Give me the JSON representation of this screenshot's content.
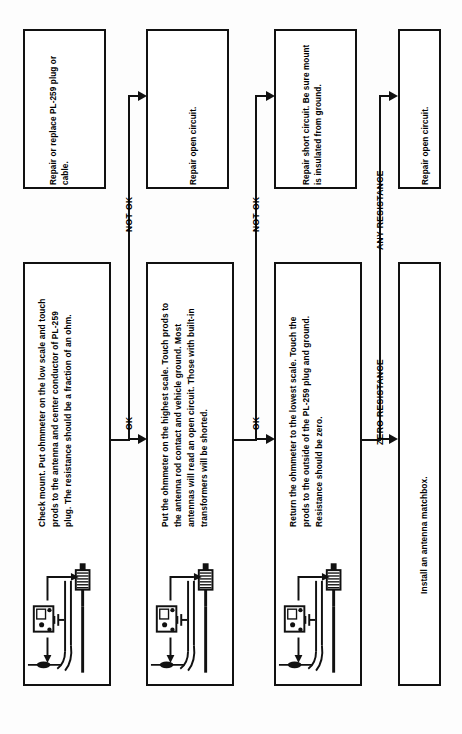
{
  "document": {
    "type": "flowchart",
    "orientation": "rotated-90-ccw",
    "title": "CB Antenna Ohmmeter Troubleshooting Flowchart"
  },
  "process_boxes": [
    {
      "id": "check-mount",
      "text": "Check mount. Put ohmmeter on the low scale and touch prods to the antenna and center conductor of PL-259 plug. The resistance should be a fraction of an ohm.",
      "has_schematic": true
    },
    {
      "id": "highest-scale",
      "text": "Put the ohmmeter on the highest scale. Touch prods to the antenna rod contact and vehicle ground. Most antennas will read an open circuit. Those with built-in transformers will be shorted.",
      "has_schematic": true
    },
    {
      "id": "lowest-scale",
      "text": "Return the ohmmeter to the lowest scale. Touch the prods to the outside of the PL-259 plug and ground. Resistance should be zero.",
      "has_schematic": true
    },
    {
      "id": "install-matchbox",
      "text": "Install an antenna matchbox.",
      "has_schematic": false
    }
  ],
  "outcome_boxes": [
    {
      "id": "repair-plug-cable",
      "text": "Repair or replace PL-259 plug or cable."
    },
    {
      "id": "repair-open-circuit-1",
      "text": "Repair open circuit."
    },
    {
      "id": "repair-short-circuit",
      "text": "Repair short circuit.  Be  sure mount is insulated from ground."
    },
    {
      "id": "repair-open-circuit-2",
      "text": "Repair open circuit."
    }
  ],
  "branch_labels": [
    {
      "id": "branch-ok-1",
      "text": "OK"
    },
    {
      "id": "branch-not-ok-1",
      "text": "NOT OK"
    },
    {
      "id": "branch-ok-2",
      "text": "OK"
    },
    {
      "id": "branch-not-ok-2",
      "text": "NOT OK"
    },
    {
      "id": "branch-zero-resistance",
      "text": "ZERO RESISTANCE"
    },
    {
      "id": "branch-any-resistance",
      "text": "ANY RESISTANCE"
    }
  ],
  "schematic": {
    "parts": [
      {
        "name": "ohmmeter-body",
        "label": ""
      },
      {
        "name": "test-prod",
        "label": ""
      },
      {
        "name": "ground-symbol",
        "label": ""
      },
      {
        "name": "pl259-plug",
        "label": ""
      },
      {
        "name": "coax-cable",
        "label": ""
      },
      {
        "name": "antenna-mount",
        "label": ""
      }
    ]
  },
  "colors": {
    "ink": "#111111",
    "paper": "#fdfdfd",
    "box_fill": "#ffffff"
  }
}
